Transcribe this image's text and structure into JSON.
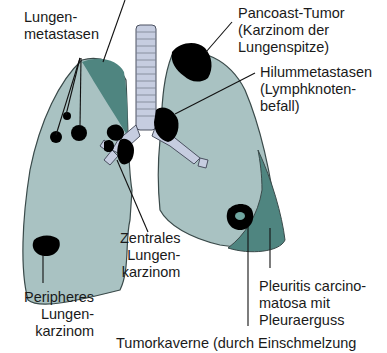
{
  "figure": {
    "colors": {
      "lung_fill": "#a9c2c2",
      "lung_outline": "#3a4a4a",
      "dark_teal": "#4f8580",
      "trachea": "#c6cde0",
      "tumor": "#000000"
    },
    "labels": {
      "lungenmetastasen": "Lungen-\nmetastasen",
      "pancoast": "Pancoast-Tumor\n(Karzinom der\nLungenspitze)",
      "hilum": "Hilummetastasen\n(Lymphknoten-\nbefall)",
      "zentrales": "Zentrales\nLungen-\nkarzinom",
      "peripheres": "Peripheres\nLungen-\nkarzinom",
      "pleuritis": "Pleuritis carcino-\nmatosa mit\nPleuraerguss",
      "tumorkaverne": "Tumorkaverne (durch Einschmelzung"
    }
  }
}
